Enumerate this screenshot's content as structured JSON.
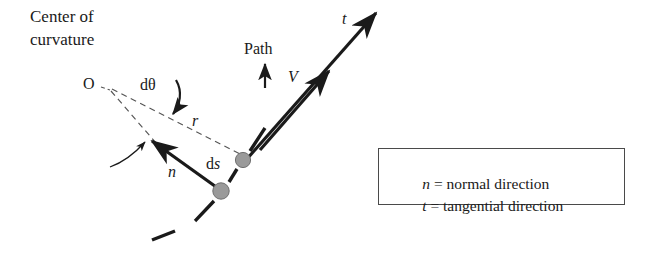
{
  "diagram": {
    "labels": {
      "center_of_curvature_line1": "Center of",
      "center_of_curvature_line2": "curvature",
      "origin": "O",
      "d_theta": "dθ",
      "radius": "r",
      "path": "Path",
      "velocity": "V",
      "tangential": "t",
      "normal": "n",
      "arc_length_d": "d",
      "arc_length_s": "s"
    },
    "legend": {
      "rows": [
        {
          "symbol": "n",
          "equals": " = ",
          "text": "normal direction"
        },
        {
          "symbol": "t",
          "equals": " = ",
          "text": "tangential direction"
        }
      ]
    },
    "colors": {
      "ink": "#1a1a1a",
      "dashed_guide": "#555555",
      "particle_dot_fill": "#9a9a9a",
      "particle_dot_stroke": "#6f6f6f",
      "legend_border": "#4a4a4a",
      "background": "#ffffff"
    },
    "geometry": {
      "origin_point": [
        103,
        86
      ],
      "particle_upper": [
        243,
        160
      ],
      "particle_lower": [
        221,
        191
      ],
      "tangent_tip": [
        378,
        10
      ],
      "velocity_tip": [
        330,
        70
      ],
      "normal_tip": [
        150,
        139
      ]
    }
  }
}
